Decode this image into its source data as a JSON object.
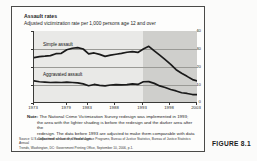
{
  "figure": {
    "number_label": "FIGURE 8.1",
    "title": "Assault rates",
    "subtitle": "Adjusted victimization rate per 1,000 persons age 12 and over",
    "note": {
      "label": "Note:",
      "line1": "The National Crime Victimization Survey redesign was implemented in 1993;",
      "line2": "the area with the lighter shading is before the redesign and the darker area after the",
      "line3": "redesign. The data before 1993 are adjusted to make them comparable with data",
      "line4": "collected since the redesign."
    },
    "source": {
      "line1": "Source: U.S. Department of Justice, Office of Justice Programs, Bureau of Justice Statistics, Bureau of Justice Statistics Annual",
      "line2": "Trends, Washington, DC: Government Printing Office, September 10, 2006, p.1."
    }
  },
  "colors": {
    "plot_background_light": "#e9e9e7",
    "plot_background_dark": "#cfcfcc",
    "line": "#1a1a1a",
    "gridline": "#9a9a96",
    "frame": "#3a3a38",
    "card_border": "#4a4a48"
  },
  "chart_data": {
    "type": "line",
    "title": "Assault rates",
    "subtitle": "Adjusted victimization rate per 1,000 persons age 12 and over",
    "xlabel": "",
    "ylabel": "",
    "xlim": [
      1973,
      2003
    ],
    "ylim": [
      0,
      40
    ],
    "yticks": [
      0,
      10,
      20,
      30,
      40
    ],
    "ytick_labels": [
      "0",
      "10",
      "20",
      "30",
      "40"
    ],
    "xticks": [
      1973,
      1979,
      1983,
      1988,
      1993,
      1998,
      2003
    ],
    "xtick_labels": [
      "1973",
      "1979",
      "1983",
      "1988",
      "1993",
      "1998",
      "2003"
    ],
    "grid": "horizontal",
    "legend": "inline-labels",
    "annotations": [
      {
        "text": "Simple assault",
        "x": 1975,
        "y": 33.5
      },
      {
        "text": "Aggravated assault",
        "x": 1975,
        "y": 16.5
      }
    ],
    "shaded_regions": [
      {
        "from": 1973,
        "to": 1993,
        "shade": "light",
        "meaning": "before redesign"
      },
      {
        "from": 1993,
        "to": 2003,
        "shade": "dark",
        "meaning": "after redesign"
      }
    ],
    "x": [
      1973,
      1974,
      1975,
      1976,
      1977,
      1978,
      1979,
      1980,
      1981,
      1982,
      1983,
      1984,
      1985,
      1986,
      1987,
      1988,
      1989,
      1990,
      1991,
      1992,
      1993,
      1994,
      1995,
      1996,
      1997,
      1998,
      1999,
      2000,
      2001,
      2002,
      2003
    ],
    "series": [
      {
        "name": "Simple assault",
        "values": [
          25.2,
          25.8,
          26.0,
          26.3,
          27.4,
          27.6,
          29.6,
          30.4,
          30.8,
          30.0,
          27.3,
          27.8,
          27.0,
          25.9,
          26.6,
          27.1,
          27.6,
          28.2,
          28.5,
          28.1,
          30.0,
          31.5,
          29.0,
          26.6,
          24.1,
          21.5,
          18.5,
          16.5,
          14.8,
          13.0,
          12.2
        ]
      },
      {
        "name": "Aggravated assault",
        "values": [
          12.3,
          11.8,
          11.6,
          11.4,
          11.5,
          11.4,
          11.6,
          11.4,
          11.2,
          10.6,
          9.6,
          10.3,
          9.8,
          9.5,
          10.0,
          10.2,
          10.1,
          10.2,
          10.6,
          10.3,
          11.8,
          11.9,
          10.9,
          9.5,
          8.6,
          7.5,
          6.7,
          5.7,
          5.3,
          4.7,
          4.6
        ]
      }
    ]
  }
}
